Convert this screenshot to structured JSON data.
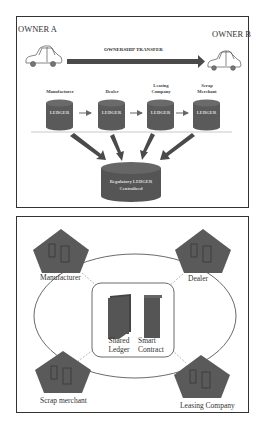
{
  "top_panel": {
    "owner_a": "OWNER A",
    "owner_b": "OWNER B",
    "transfer_label": "OWNERSHIP TRANSFER",
    "ledgers": [
      {
        "party_line1": "Manufacturer",
        "party_line2": "",
        "label": "LEDGER"
      },
      {
        "party_line1": "Dealer",
        "party_line2": "",
        "label": "LEDGER"
      },
      {
        "party_line1": "Leasing",
        "party_line2": "Company",
        "label": "LEDGER"
      },
      {
        "party_line1": "Scrap",
        "party_line2": "Merchant",
        "label": "LEDGER"
      }
    ],
    "central_ledger": {
      "line1": "Regulatory LEDGER",
      "line2": "Centralized"
    },
    "colors": {
      "cylinder": "#555555",
      "arrow": "#444444",
      "transfer_arrow": "#4a4a4a"
    }
  },
  "bottom_panel": {
    "nodes": [
      {
        "label": "Manufacturer"
      },
      {
        "label": "Dealer"
      },
      {
        "label": "Scrap merchant"
      },
      {
        "label": "Leasing Company"
      }
    ],
    "center": {
      "shared_ledger_line1": "Shared",
      "shared_ledger_line2": "Ledger",
      "smart_contract_line1": "Smart",
      "smart_contract_line2": "Contract"
    },
    "colors": {
      "pentagon": "#5a5a5a"
    }
  }
}
